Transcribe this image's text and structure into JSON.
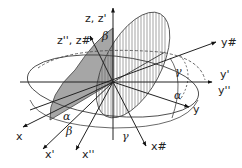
{
  "diagram": {
    "type": "euler-angle-rotation",
    "axis_labels": {
      "z": "z, z'",
      "z2": "z'', z#",
      "y_hash": "y#",
      "y_prime": "y'",
      "y_double": "y''",
      "y": "y",
      "x": "x",
      "x_prime": "x'",
      "x_double": "x''",
      "x_hash": "x#"
    },
    "angle_labels": {
      "alpha_1": "α",
      "alpha_2": "α",
      "beta_1": "β",
      "beta_2": "β",
      "gamma_1": "γ",
      "gamma_2": "γ"
    },
    "colors": {
      "line": "#333333",
      "shaded_plane": "#a6a6a6",
      "hatch": "#555555"
    }
  }
}
